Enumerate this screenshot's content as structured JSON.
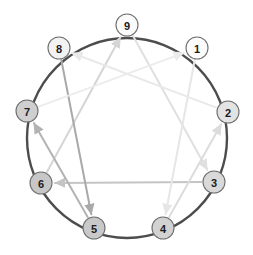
{
  "diagram": {
    "type": "enneagram-figure",
    "background_color": "#ffffff",
    "ring": {
      "center_x": 127,
      "center_y": 138,
      "radius": 100,
      "stroke_color": "#4d4d4d",
      "stroke_width": 2.4
    },
    "node_style": {
      "radius": 11,
      "border_color": "#6f6f6f",
      "label_color": "#1b1b1b"
    },
    "nodes": [
      {
        "id": "9",
        "label": "9",
        "cx": 127,
        "cy": 25,
        "fill": "#fbfbfb"
      },
      {
        "id": "1",
        "label": "1",
        "cx": 197,
        "cy": 48,
        "fill": "#fcfcfc"
      },
      {
        "id": "2",
        "label": "2",
        "cx": 228,
        "cy": 112,
        "fill": "#e3e3e3"
      },
      {
        "id": "3",
        "label": "3",
        "cx": 214,
        "cy": 182,
        "fill": "#d9d9d9"
      },
      {
        "id": "4",
        "label": "4",
        "cx": 163,
        "cy": 228,
        "fill": "#d2d2d2"
      },
      {
        "id": "5",
        "label": "5",
        "cx": 94,
        "cy": 228,
        "fill": "#c9c9c9"
      },
      {
        "id": "6",
        "label": "6",
        "cx": 41,
        "cy": 183,
        "fill": "#c7c7c7"
      },
      {
        "id": "7",
        "label": "7",
        "cx": 27,
        "cy": 111,
        "fill": "#cfcfcf"
      },
      {
        "id": "8",
        "label": "8",
        "cx": 59,
        "cy": 48,
        "fill": "#f2f2f2"
      }
    ],
    "triangle": {
      "name": "inner-triangle",
      "sequence": [
        "9",
        "3",
        "6"
      ],
      "arrows": [
        {
          "from": "9",
          "to": "3",
          "color": "#e0e0e0"
        },
        {
          "from": "3",
          "to": "6",
          "color": "#c4c4c4"
        },
        {
          "from": "6",
          "to": "9",
          "color": "#d5d5d5"
        }
      ]
    },
    "hexad": {
      "name": "hexad-path",
      "sequence": [
        "1",
        "4",
        "2",
        "8",
        "5",
        "7"
      ],
      "arrows": [
        {
          "from": "1",
          "to": "4",
          "color": "#e6e6e6"
        },
        {
          "from": "4",
          "to": "2",
          "color": "#dcdcdc"
        },
        {
          "from": "2",
          "to": "8",
          "color": "#e9e9e9"
        },
        {
          "from": "8",
          "to": "5",
          "color": "#a9a9a9"
        },
        {
          "from": "5",
          "to": "7",
          "color": "#b3b3b3"
        },
        {
          "from": "7",
          "to": "1",
          "color": "#ececec"
        }
      ]
    }
  }
}
